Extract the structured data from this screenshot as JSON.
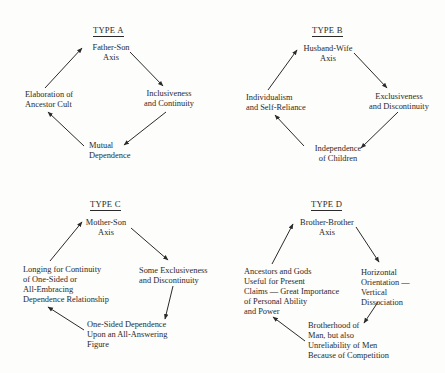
{
  "diagrams": [
    {
      "title": "TYPE A",
      "nodes": {
        "top": "Father-Son\nAxis",
        "right": "Inclusiveness\nand Continuity",
        "bottom": "Mutual\nDependence",
        "left": "Elaboration of\nAncestor Cult"
      }
    },
    {
      "title": "TYPE B",
      "nodes": {
        "top": "Husband-Wife\nAxis",
        "right": "Exclusiveness\nand Discontinuity",
        "bottom": "Independence\nof Children",
        "left": "Individualism\nand Self-Reliance"
      }
    },
    {
      "title": "TYPE C",
      "nodes": {
        "top": "Mother-Son\nAxis",
        "right": "Some Exclusiveness\nand Discontinuity",
        "bottom": "One-Sided Dependence\nUpon an All-Answering\nFigure",
        "left": "Longing for Continuity\nof One-Sided or\nAll-Embracing\nDependence Relationship"
      }
    },
    {
      "title": "TYPE D",
      "nodes": {
        "top": "Brother-Brother\nAxis",
        "right": "Horizontal\nOrientation —\nVertical\nDissociation",
        "bottom": "Brotherhood of\nMan, but also\nUnreliability of Men\nBecause of Competition",
        "left": "Ancestors and Gods\nUseful for Present\nClaims — Great Importance\nof Personal Ability\nand Power"
      }
    }
  ],
  "colors": {
    "ink": "#2a2a2a",
    "paper": "#fdfdfb"
  }
}
